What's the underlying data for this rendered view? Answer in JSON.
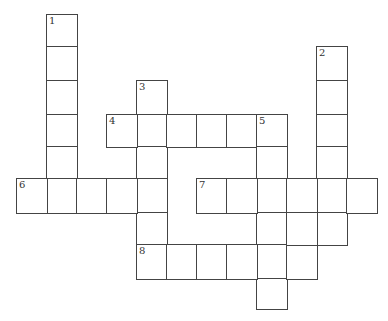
{
  "puzzle": {
    "cell_size": 30,
    "col_x": [
      16,
      46,
      76,
      106,
      136,
      166,
      196,
      226,
      256,
      286,
      316,
      346
    ],
    "row_y": [
      14,
      46,
      80,
      114,
      146,
      178,
      212,
      244,
      278
    ],
    "clues": [
      {
        "number": "1",
        "direction": "down",
        "row": 0,
        "col": 1,
        "length": 6
      },
      {
        "number": "2",
        "direction": "down",
        "row": 1,
        "col": 10,
        "length": 6
      },
      {
        "number": "3",
        "direction": "down",
        "row": 2,
        "col": 4,
        "length": 6
      },
      {
        "number": "4",
        "direction": "across",
        "row": 3,
        "col": 3,
        "length": 6
      },
      {
        "number": "5",
        "direction": "down",
        "row": 3,
        "col": 8,
        "length": 6
      },
      {
        "number": "6",
        "direction": "across",
        "row": 5,
        "col": 0,
        "length": 5
      },
      {
        "number": "7",
        "direction": "across",
        "row": 5,
        "col": 6,
        "length": 6
      },
      {
        "number": "8",
        "direction": "across",
        "row": 7,
        "col": 4,
        "length": 6
      }
    ],
    "extra_cells": [
      [
        6,
        9
      ]
    ]
  }
}
